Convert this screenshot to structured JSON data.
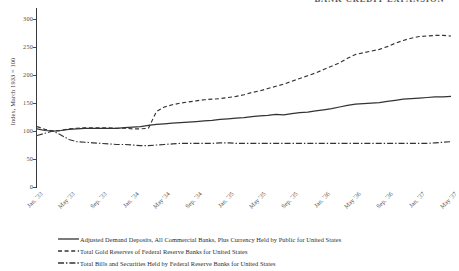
{
  "clipped_title": "BANK CREDIT EXPANSION",
  "chart_data": {
    "type": "line",
    "title": "",
    "xlabel": "",
    "ylabel": "Index, March 1933 = 100",
    "ylim": [
      0,
      320
    ],
    "yticks": [
      0,
      50,
      100,
      150,
      200,
      250,
      300
    ],
    "ytick_labels": [
      "0",
      "50",
      "100",
      "150",
      "200",
      "250",
      "300"
    ],
    "grid": false,
    "legend_position": "below",
    "xtick_labels": [
      "Jan. '33",
      "May '33",
      "Sep. '33",
      "Jan. '34",
      "May '34",
      "Sep. '34",
      "Jan. '35",
      "May '35",
      "Sep. '35",
      "Jan. '36",
      "May '36",
      "Sep. '36",
      "Jan. '37",
      "May '37"
    ],
    "x": [
      "Jan. '33",
      "Feb. '33",
      "Mar. '33",
      "Apr. '33",
      "May '33",
      "Jun. '33",
      "Jul. '33",
      "Aug. '33",
      "Sep. '33",
      "Oct. '33",
      "Nov. '33",
      "Dec. '33",
      "Jan. '34",
      "Feb. '34",
      "Mar. '34",
      "Apr. '34",
      "May '34",
      "Jun. '34",
      "Jul. '34",
      "Aug. '34",
      "Sep. '34",
      "Oct. '34",
      "Nov. '34",
      "Dec. '34",
      "Jan. '35",
      "Feb. '35",
      "Mar. '35",
      "Apr. '35",
      "May '35",
      "Jun. '35",
      "Jul. '35",
      "Aug. '35",
      "Sep. '35",
      "Oct. '35",
      "Nov. '35",
      "Dec. '35",
      "Jan. '36",
      "Feb. '36",
      "Mar. '36",
      "Apr. '36",
      "May '36",
      "Jun. '36",
      "Jul. '36",
      "Aug. '36",
      "Sep. '36",
      "Oct. '36",
      "Nov. '36",
      "Dec. '36",
      "Jan. '37",
      "Feb. '37",
      "Mar. '37",
      "Apr. '37",
      "May '37"
    ],
    "series": [
      {
        "name": "Adjusted Demand Deposits, All Commercial Banks, Plus Currency Held by Public for United States",
        "style": "solid",
        "color": "#333333",
        "values": [
          104,
          101,
          100,
          101,
          103,
          104,
          105,
          105,
          105,
          105,
          105,
          106,
          107,
          108,
          110,
          112,
          113,
          114,
          115,
          116,
          117,
          118,
          119,
          121,
          122,
          123,
          124,
          126,
          127,
          128,
          130,
          129,
          131,
          133,
          134,
          136,
          138,
          140,
          143,
          146,
          148,
          149,
          150,
          151,
          153,
          155,
          157,
          158,
          159,
          160,
          161,
          161,
          162
        ]
      },
      {
        "name": "Total Gold Reserves of Federal Reserve Banks for United States",
        "style": "dashed",
        "color": "#333333",
        "values": [
          108,
          103,
          100,
          101,
          104,
          105,
          106,
          106,
          106,
          106,
          105,
          105,
          104,
          104,
          105,
          135,
          143,
          147,
          150,
          152,
          154,
          156,
          157,
          158,
          160,
          162,
          165,
          169,
          172,
          176,
          180,
          184,
          189,
          194,
          199,
          204,
          210,
          216,
          222,
          230,
          237,
          240,
          243,
          246,
          251,
          257,
          262,
          266,
          269,
          270,
          271,
          271,
          270
        ]
      },
      {
        "name": "Total Bills and Securities Held by Federal Reserve Banks for United States",
        "style": "dashdot",
        "color": "#333333",
        "values": [
          92,
          96,
          100,
          93,
          85,
          81,
          80,
          79,
          78,
          77,
          76,
          76,
          75,
          74,
          74,
          75,
          76,
          77,
          78,
          78,
          78,
          78,
          78,
          79,
          79,
          78,
          78,
          78,
          78,
          78,
          78,
          78,
          78,
          78,
          78,
          78,
          78,
          78,
          78,
          78,
          78,
          78,
          78,
          78,
          78,
          78,
          78,
          78,
          78,
          78,
          79,
          80,
          81
        ]
      }
    ]
  }
}
